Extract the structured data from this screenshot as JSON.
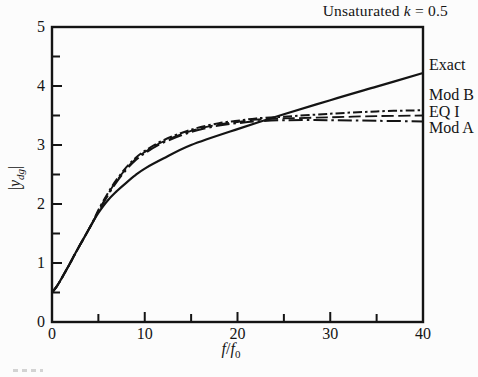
{
  "header": {
    "title_prefix": "Unsaturated ",
    "title_var": "k",
    "title_suffix": " = 0.5"
  },
  "axes": {
    "y_label": {
      "open_bar": "|",
      "variable": "y",
      "subscript": "dg",
      "close_bar": "|"
    },
    "x_label": {
      "numerator": "f",
      "slash": "/",
      "denominator": "f",
      "subscript": "0"
    }
  },
  "colors": {
    "ink": "#141414",
    "paper": "#fcfcfc"
  },
  "chart_data": {
    "type": "line",
    "title": "Unsaturated k = 0.5",
    "xlabel": "f/f0",
    "ylabel": "|y_dg|",
    "xlim": [
      0,
      40
    ],
    "ylim": [
      0,
      5
    ],
    "grid": false,
    "legend_position": "right-outside",
    "x_ticks": {
      "labeled": [
        0,
        10,
        20,
        30,
        40
      ],
      "labels": [
        "0",
        "10",
        "20",
        "30",
        "40"
      ],
      "marks_major": [
        10,
        20,
        30
      ],
      "marks_minor": [
        5,
        15,
        25,
        35
      ]
    },
    "y_ticks": {
      "labeled": [
        0,
        1,
        2,
        3,
        4,
        5
      ],
      "labels": [
        "0",
        "1",
        "2",
        "3",
        "4",
        "5"
      ],
      "marks_major": [
        1,
        2,
        3,
        4
      ],
      "marks_minor": [
        0.5,
        1.5,
        2.5,
        3.5,
        4.5
      ]
    },
    "series": [
      {
        "name": "Exact",
        "style": "solid",
        "stroke_width": 2.2,
        "x": [
          0,
          0.5,
          1,
          1.5,
          2,
          2.5,
          3,
          3.5,
          4,
          4.5,
          5,
          6,
          7,
          8,
          9,
          10,
          12,
          15,
          20,
          25,
          30,
          35,
          40
        ],
        "y": [
          0.5,
          0.6,
          0.73,
          0.87,
          1.01,
          1.16,
          1.3,
          1.44,
          1.58,
          1.72,
          1.85,
          2.06,
          2.22,
          2.36,
          2.49,
          2.6,
          2.77,
          3.0,
          3.27,
          3.52,
          3.76,
          3.99,
          4.22
        ]
      },
      {
        "name": "Mod B",
        "style": "dashdot",
        "stroke_width": 2.0,
        "x": [
          0,
          0.5,
          1,
          1.5,
          2,
          2.5,
          3,
          3.5,
          4,
          4.5,
          5,
          6,
          7,
          8,
          9,
          10,
          12,
          15,
          18,
          20,
          22,
          25,
          30,
          35,
          40
        ],
        "y": [
          0.5,
          0.6,
          0.73,
          0.87,
          1.01,
          1.16,
          1.3,
          1.44,
          1.58,
          1.73,
          1.9,
          2.18,
          2.42,
          2.62,
          2.78,
          2.9,
          3.08,
          3.26,
          3.37,
          3.41,
          3.45,
          3.48,
          3.53,
          3.57,
          3.59
        ]
      },
      {
        "name": "EQ I",
        "style": "dash",
        "stroke_width": 1.8,
        "x": [
          0,
          0.5,
          1,
          1.5,
          2,
          2.5,
          3,
          3.5,
          4,
          4.5,
          5,
          6,
          7,
          8,
          9,
          10,
          12,
          15,
          18,
          20,
          22,
          25,
          30,
          35,
          40
        ],
        "y": [
          0.5,
          0.6,
          0.73,
          0.87,
          1.01,
          1.16,
          1.3,
          1.44,
          1.58,
          1.72,
          1.88,
          2.16,
          2.4,
          2.6,
          2.76,
          2.88,
          3.06,
          3.24,
          3.35,
          3.39,
          3.43,
          3.45,
          3.47,
          3.49,
          3.5
        ]
      },
      {
        "name": "Mod A",
        "style": "dashdot-long",
        "stroke_width": 2.0,
        "x": [
          0,
          0.5,
          1,
          1.5,
          2,
          2.5,
          3,
          3.5,
          4,
          4.5,
          5,
          6,
          7,
          8,
          9,
          10,
          12,
          15,
          18,
          20,
          22,
          25,
          30,
          35,
          40
        ],
        "y": [
          0.5,
          0.6,
          0.73,
          0.87,
          1.01,
          1.16,
          1.3,
          1.44,
          1.58,
          1.72,
          1.87,
          2.14,
          2.38,
          2.58,
          2.74,
          2.86,
          3.04,
          3.22,
          3.33,
          3.37,
          3.4,
          3.42,
          3.42,
          3.41,
          3.4
        ]
      }
    ]
  }
}
